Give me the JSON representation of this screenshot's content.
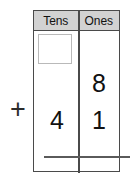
{
  "worksheet": {
    "type": "place-value-addition",
    "columns": [
      {
        "id": "tens",
        "label": "Tens"
      },
      {
        "id": "ones",
        "label": "Ones"
      }
    ],
    "carry_row": {
      "tens_value": "",
      "ones_value": ""
    },
    "rows": [
      {
        "id": "addend-1",
        "tens": "",
        "ones": "8"
      },
      {
        "id": "addend-2",
        "tens": "4",
        "ones": "1"
      },
      {
        "id": "sum",
        "tens": "",
        "ones": ""
      }
    ],
    "operator": "+",
    "colors": {
      "grid_line": "#4a4a4a",
      "header_fill": "#d2d2d2",
      "carry_box_border": "#b9b9b9",
      "digit": "#111111",
      "rule": "#5a5a5a",
      "background": "#ffffff"
    }
  }
}
